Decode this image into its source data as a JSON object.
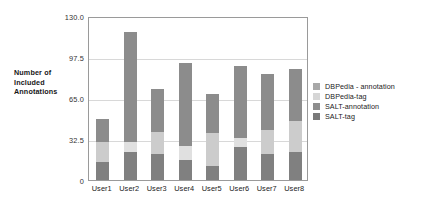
{
  "chart_data": {
    "type": "bar",
    "stacked": true,
    "title": "",
    "xlabel": "",
    "ylabel": "Number of Included Annotations",
    "ylim": [
      0,
      130
    ],
    "yticks": [
      "0",
      "32.5",
      "65.0",
      "97.5",
      "130.0"
    ],
    "ytick_values": [
      0,
      32.5,
      65,
      97.5,
      130
    ],
    "grid": true,
    "legend_position": "right",
    "categories": [
      "User1",
      "User2",
      "User3",
      "User4",
      "User5",
      "User6",
      "User7",
      "User8"
    ],
    "series": [
      {
        "name": "SALT-tag",
        "color": "#808080",
        "values": [
          14,
          22,
          21,
          16,
          11,
          26,
          21,
          22
        ]
      },
      {
        "name": "SALT-annotation",
        "color": "#cccccc",
        "values": [
          16,
          0,
          17,
          0,
          26,
          0,
          19,
          25
        ]
      },
      {
        "name": "DBPedia-tag",
        "color": "#e0e0e0",
        "values": [
          0,
          8,
          0,
          11,
          0,
          7,
          0,
          0
        ]
      },
      {
        "name": "DBPedia - annotation",
        "color": "#8c8c8c",
        "values": [
          18,
          87,
          34,
          66,
          31,
          57,
          44,
          41
        ]
      }
    ],
    "totals": [
      48,
      117,
      72,
      93,
      68,
      90,
      84,
      88
    ]
  },
  "axis": {
    "y_title_lines": [
      "Number of",
      "Included",
      "Annotations"
    ],
    "y_tick_labels": [
      "130.0",
      "97.5",
      "65.0",
      "32.5",
      "0"
    ],
    "x_tick_labels": [
      "User1",
      "User2",
      "User3",
      "User4",
      "User5",
      "User6",
      "User7",
      "User8"
    ]
  },
  "legend": {
    "items": [
      {
        "label": "DBPedia - annotation",
        "color": "#a8a8a8"
      },
      {
        "label": "DBPedia-tag",
        "color": "#d6d6d6"
      },
      {
        "label": "SALT-annotation",
        "color": "#8e8e8e"
      },
      {
        "label": "SALT-tag",
        "color": "#7a7a7a"
      }
    ]
  },
  "colors": {
    "frame": "#9a9a9a",
    "grid": "#d8d8d8",
    "background": "#ffffff"
  }
}
